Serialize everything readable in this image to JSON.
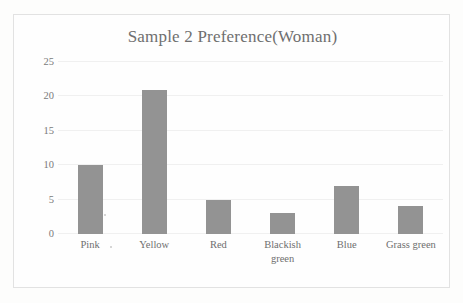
{
  "chart_data": {
    "type": "bar",
    "title": "Sample 2 Preference(Woman)",
    "xlabel": "",
    "ylabel": "",
    "categories": [
      "Pink",
      "Yellow",
      "Red",
      "Blackish green",
      "Blue",
      "Grass green"
    ],
    "category_lines": [
      [
        "Pink"
      ],
      [
        "Yellow"
      ],
      [
        "Red"
      ],
      [
        "Blackish",
        "green"
      ],
      [
        "Blue"
      ],
      [
        "Grass green"
      ]
    ],
    "values": [
      10,
      21,
      5,
      3,
      7,
      4
    ],
    "ylim": [
      0,
      25
    ],
    "yticks": [
      0,
      5,
      10,
      15,
      20,
      25
    ],
    "ytick_labels": [
      "0",
      "5",
      "10",
      "15",
      "20",
      "25"
    ],
    "grid": true,
    "legend": false,
    "bar_color": "#939393",
    "title_color": "#6f6f6f",
    "gridline_color": "#f0f0f0",
    "tick_label_color": "#7a7a7a",
    "frame_color": "#e2e2e2",
    "background_color": "#fefefe"
  }
}
